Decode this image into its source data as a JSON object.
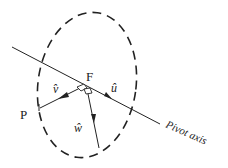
{
  "diagram": {
    "labels": {
      "pivot_point": "F",
      "point": "P",
      "u_vector": "û",
      "v_vector": "v̂",
      "w_vector": "ŵ",
      "axis": "Pivot axis"
    },
    "colors": {
      "stroke": "#222222",
      "background": "#ffffff"
    }
  }
}
